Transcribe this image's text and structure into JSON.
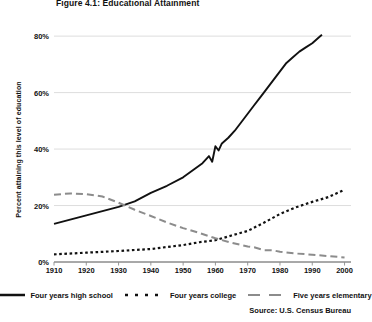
{
  "figure": {
    "title": "Figure 4.1: Educational Attainment",
    "source": "Source: U.S. Census Bureau",
    "ylabel": "Percent attaining this level of education"
  },
  "legend": {
    "items": [
      {
        "label": "Four years high school",
        "style": "solid",
        "color": "#111111",
        "icon": "solid-line-swatch"
      },
      {
        "label": "Four years college",
        "style": "dotted",
        "color": "#111111",
        "icon": "dotted-line-swatch"
      },
      {
        "label": "Five years elementary",
        "style": "dashed",
        "color": "#8c8c8c",
        "icon": "dashed-line-swatch"
      }
    ]
  },
  "chart_data": {
    "type": "line",
    "title": "Figure 4.1: Educational Attainment",
    "subtitle": "",
    "xlabel": "",
    "ylabel": "Percent attaining this level of education",
    "xlim": [
      1910,
      2002
    ],
    "ylim": [
      0,
      85
    ],
    "yticks": [
      0,
      20,
      40,
      60,
      80
    ],
    "ytick_labels": [
      "0%",
      "20%",
      "40%",
      "60%",
      "80%"
    ],
    "xticks": [
      1910,
      1920,
      1930,
      1940,
      1950,
      1960,
      1970,
      1980,
      1990,
      2000
    ],
    "xtick_labels": [
      "1910",
      "1920",
      "1930",
      "1940",
      "1950",
      "1960",
      "1970",
      "1980",
      "1990",
      "2000"
    ],
    "grid": "horizontal",
    "legend_position": "bottom",
    "source": "Source: U.S. Census Bureau",
    "series": [
      {
        "name": "Four years high school",
        "style": "solid",
        "color": "#111111",
        "x": [
          1910,
          1915,
          1920,
          1925,
          1930,
          1935,
          1940,
          1945,
          1950,
          1953,
          1956,
          1958,
          1959,
          1960,
          1961,
          1962,
          1964,
          1966,
          1968,
          1970,
          1972,
          1974,
          1976,
          1978,
          1980,
          1982,
          1984,
          1986,
          1988,
          1990,
          1992,
          1993
        ],
        "y": [
          13.5,
          15.0,
          16.5,
          18.0,
          19.5,
          21.5,
          24.5,
          27.0,
          30.0,
          32.5,
          35.0,
          37.5,
          35.5,
          41.0,
          39.5,
          42.0,
          44.0,
          46.5,
          49.5,
          52.5,
          55.5,
          58.5,
          61.5,
          64.5,
          67.5,
          70.5,
          72.5,
          74.5,
          76.0,
          77.5,
          79.5,
          80.5
        ]
      },
      {
        "name": "Four years college",
        "style": "dotted",
        "color": "#111111",
        "x": [
          1910,
          1920,
          1930,
          1940,
          1950,
          1955,
          1960,
          1965,
          1970,
          1975,
          1980,
          1985,
          1990,
          1995,
          2000
        ],
        "y": [
          2.7,
          3.3,
          3.9,
          4.6,
          6.0,
          7.0,
          7.7,
          9.4,
          11.0,
          13.9,
          17.0,
          19.4,
          21.3,
          23.0,
          25.6
        ]
      },
      {
        "name": "Five years elementary",
        "style": "dashed",
        "color": "#8c8c8c",
        "x": [
          1910,
          1915,
          1920,
          1925,
          1930,
          1935,
          1940,
          1945,
          1950,
          1955,
          1960,
          1965,
          1970,
          1972,
          1975,
          1978,
          1980,
          1985,
          1990,
          1995,
          2000
        ],
        "y": [
          23.8,
          24.3,
          24.0,
          23.2,
          21.0,
          18.5,
          16.3,
          14.0,
          12.0,
          10.3,
          8.4,
          6.8,
          5.5,
          5.2,
          4.2,
          4.1,
          3.6,
          3.0,
          2.6,
          2.1,
          1.6
        ]
      }
    ]
  }
}
